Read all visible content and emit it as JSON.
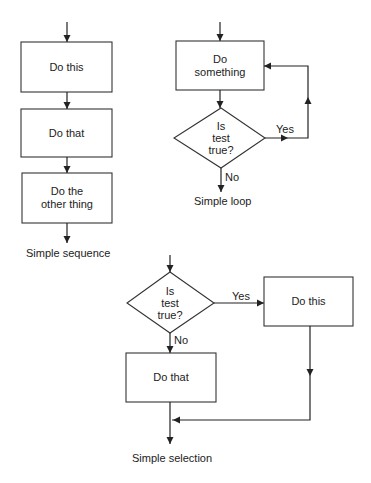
{
  "diagrams": [
    {
      "caption": "Simple sequence",
      "nodes": [
        {
          "type": "process",
          "label": "Do this"
        },
        {
          "type": "process",
          "label": "Do that"
        },
        {
          "type": "process",
          "label_line1": "Do the",
          "label_line2": "other thing"
        }
      ]
    },
    {
      "caption": "Simple loop",
      "nodes": [
        {
          "type": "process",
          "label_line1": "Do",
          "label_line2": "something"
        },
        {
          "type": "decision",
          "label_line1": "Is",
          "label_line2": "test",
          "label_line3": "true?"
        }
      ],
      "edges": {
        "yes": "Yes",
        "no": "No"
      }
    },
    {
      "caption": "Simple selection",
      "nodes": [
        {
          "type": "decision",
          "label_line1": "Is",
          "label_line2": "test",
          "label_line3": "true?"
        },
        {
          "type": "process",
          "label": "Do this"
        },
        {
          "type": "process",
          "label": "Do that"
        }
      ],
      "edges": {
        "yes": "Yes",
        "no": "No"
      }
    }
  ],
  "colors": {
    "stroke": "#222222",
    "background": "#ffffff"
  }
}
